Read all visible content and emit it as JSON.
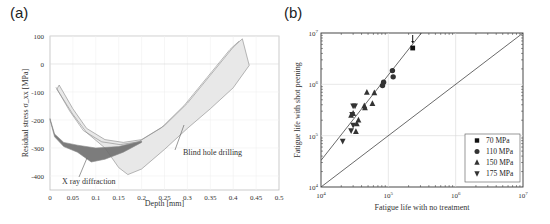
{
  "panels": {
    "a_label": "(a)",
    "b_label": "(b)"
  },
  "chart_data": [
    {
      "id": "a",
      "type": "area",
      "title": "",
      "xlabel": "Depth [mm]",
      "ylabel": "Residual stress σ_xx [MPa]",
      "xlim": [
        0,
        0.5
      ],
      "ylim": [
        -450,
        100
      ],
      "xticks": [
        "0",
        "0.05",
        "0.1",
        "0.15",
        "0.2",
        "0.25",
        "0.3",
        "0.35",
        "0.4",
        "0.45",
        "0.5"
      ],
      "yticks": [
        "100",
        "0",
        "-100",
        "-200",
        "-300",
        "-400"
      ],
      "grid": true,
      "annotations": [
        "X ray diffraction",
        "Blind hole drilling"
      ],
      "series": [
        {
          "name": "X ray diffraction",
          "fill": "#6e6e6e",
          "upper": [
            [
              0,
              -195
            ],
            [
              0.01,
              -250
            ],
            [
              0.03,
              -280
            ],
            [
              0.06,
              -290
            ],
            [
              0.1,
              -300
            ],
            [
              0.15,
              -295
            ],
            [
              0.2,
              -275
            ]
          ],
          "lower": [
            [
              0,
              -200
            ],
            [
              0.01,
              -260
            ],
            [
              0.03,
              -295
            ],
            [
              0.06,
              -315
            ],
            [
              0.09,
              -350
            ],
            [
              0.12,
              -340
            ],
            [
              0.16,
              -315
            ],
            [
              0.2,
              -280
            ]
          ]
        },
        {
          "name": "Blind hole drilling",
          "fill": "#e8e8e8",
          "upper": [
            [
              0.02,
              -75
            ],
            [
              0.05,
              -160
            ],
            [
              0.08,
              -230
            ],
            [
              0.12,
              -270
            ],
            [
              0.16,
              -280
            ],
            [
              0.2,
              -270
            ],
            [
              0.25,
              -220
            ],
            [
              0.3,
              -140
            ],
            [
              0.35,
              -40
            ],
            [
              0.4,
              60
            ],
            [
              0.42,
              90
            ]
          ],
          "lower": [
            [
              0.015,
              -90
            ],
            [
              0.05,
              -180
            ],
            [
              0.08,
              -245
            ],
            [
              0.12,
              -300
            ],
            [
              0.15,
              -370
            ],
            [
              0.17,
              -395
            ],
            [
              0.2,
              -375
            ],
            [
              0.25,
              -305
            ],
            [
              0.3,
              -230
            ],
            [
              0.35,
              -160
            ],
            [
              0.4,
              -85
            ],
            [
              0.435,
              -5
            ]
          ]
        }
      ]
    },
    {
      "id": "b",
      "type": "scatter",
      "title": "",
      "xlabel": "Fatigue life with no treatment",
      "ylabel": "Fatigue life with shot peening",
      "xscale": "log",
      "yscale": "log",
      "xlim": [
        10000,
        10000000
      ],
      "ylim": [
        10000,
        10000000
      ],
      "xticks": [
        "10^4",
        "10^5",
        "10^6",
        "10^7"
      ],
      "yticks": [
        "10^7",
        "10^6",
        "10^5",
        "10^4"
      ],
      "grid": true,
      "legend_position": "lower right",
      "lines": [
        {
          "name": "1:1 line",
          "points": [
            [
              10000,
              10000
            ],
            [
              10000000,
              10000000
            ]
          ]
        },
        {
          "name": "fit",
          "points": [
            [
              10000,
              33000
            ],
            [
              310000,
              10000000
            ]
          ]
        }
      ],
      "series": [
        {
          "name": "70 MPa",
          "marker": "square",
          "points": [
            [
              230000,
              5100000
            ]
          ]
        },
        {
          "name": "110 MPa",
          "marker": "circle",
          "points": [
            [
              115000,
              1850000
            ],
            [
              118000,
              1400000
            ],
            [
              85000,
              1100000
            ],
            [
              82000,
              950000
            ]
          ]
        },
        {
          "name": "150 MPa",
          "marker": "triangle-up",
          "points": [
            [
              48000,
              700000
            ],
            [
              62000,
              680000
            ],
            [
              58000,
              420000
            ],
            [
              44000,
              380000
            ],
            [
              45000,
              350000
            ],
            [
              36000,
              200000
            ],
            [
              34000,
              170000
            ],
            [
              28000,
              250000
            ],
            [
              30000,
              270000
            ],
            [
              33000,
              120000
            ]
          ]
        },
        {
          "name": "175 MPa",
          "marker": "triangle-down",
          "points": [
            [
              30000,
              380000
            ],
            [
              32000,
              380000
            ],
            [
              29000,
              260000
            ],
            [
              30000,
              160000
            ],
            [
              28000,
              125000
            ],
            [
              21000,
              78000
            ]
          ]
        }
      ],
      "annotations": [
        "arrow above 70 MPa point"
      ]
    }
  ]
}
